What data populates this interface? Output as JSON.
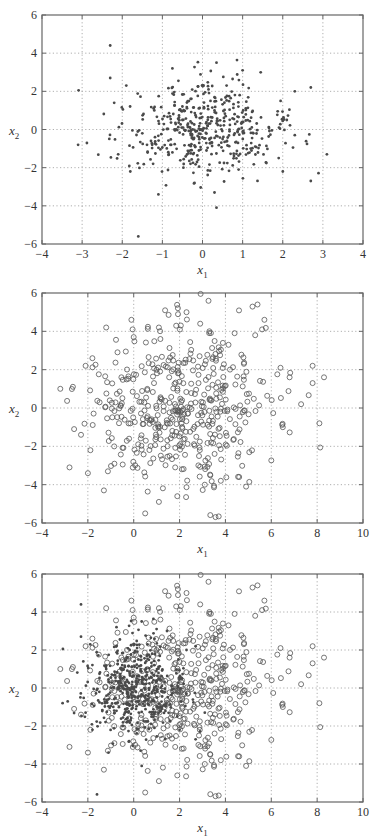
{
  "chart_data": [
    {
      "type": "scatter",
      "title": "",
      "xlabel": "x1",
      "ylabel": "x2",
      "xlim": [
        -4,
        4
      ],
      "ylim": [
        -6,
        6
      ],
      "xticks": [
        -4,
        -3,
        -2,
        -1,
        0,
        1,
        2,
        3,
        4
      ],
      "yticks": [
        -6,
        -4,
        -2,
        0,
        2,
        4,
        6
      ],
      "grid": true,
      "legend": null,
      "series": [
        {
          "name": "class 1",
          "marker": "dot",
          "color": "#4a4a4a",
          "approx_count": 500,
          "distribution": {
            "mean": [
              0,
              0
            ],
            "std": [
              1,
              1.2
            ]
          },
          "sample_points": [
            [
              -2.3,
              4.4
            ],
            [
              -2.3,
              2.7
            ],
            [
              -3.1,
              -0.8
            ],
            [
              3.1,
              -1.3
            ],
            [
              2.7,
              2.2
            ],
            [
              2.7,
              -2.7
            ],
            [
              -1.6,
              -5.6
            ],
            [
              0.35,
              3.5
            ],
            [
              1.0,
              3.1
            ],
            [
              1.45,
              3.0
            ],
            [
              2.3,
              2.0
            ],
            [
              0.35,
              -4.1
            ],
            [
              -0.75,
              3.2
            ],
            [
              -1.9,
              2.3
            ],
            [
              -2.2,
              1.4
            ],
            [
              -2.1,
              -1.3
            ],
            [
              -1.8,
              -2.2
            ],
            [
              1.9,
              -1.5
            ],
            [
              2.0,
              -2.2
            ],
            [
              2.3,
              -0.3
            ],
            [
              2.1,
              0.5
            ],
            [
              -1.1,
              -3.4
            ],
            [
              0.3,
              -3.3
            ],
            [
              -0.2,
              -2.8
            ],
            [
              0.0,
              0.0
            ],
            [
              0.5,
              -0.5
            ],
            [
              -0.5,
              0.5
            ],
            [
              0.8,
              0.8
            ],
            [
              -0.8,
              -0.8
            ],
            [
              0.2,
              1.5
            ],
            [
              -1.2,
              1.0
            ],
            [
              1.2,
              -1.0
            ],
            [
              0.9,
              -2.1
            ],
            [
              -0.3,
              -1.8
            ],
            [
              0.6,
              2.3
            ],
            [
              -1.5,
              -0.2
            ]
          ]
        }
      ]
    },
    {
      "type": "scatter",
      "title": "",
      "xlabel": "x1",
      "ylabel": "x2",
      "xlim": [
        -4,
        10
      ],
      "ylim": [
        -6,
        6
      ],
      "xticks": [
        -4,
        -2,
        0,
        2,
        4,
        6,
        8,
        10
      ],
      "yticks": [
        -6,
        -4,
        -2,
        0,
        2,
        4,
        6
      ],
      "grid": true,
      "legend": null,
      "series": [
        {
          "name": "class 2",
          "marker": "circle",
          "color": "#555555",
          "approx_count": 500,
          "distribution": {
            "mean": [
              2,
              0
            ],
            "std": [
              2,
              2
            ]
          },
          "sample_points": [
            [
              5.4,
              5.4
            ],
            [
              2.3,
              5.0
            ],
            [
              -0.1,
              4.6
            ],
            [
              5.7,
              4.6
            ],
            [
              2.9,
              4.4
            ],
            [
              -1.2,
              4.2
            ],
            [
              1.1,
              4.2
            ],
            [
              5.6,
              4.1
            ],
            [
              5.3,
              3.8
            ],
            [
              3.3,
              4.0
            ],
            [
              4.4,
              3.9
            ],
            [
              -3.2,
              1.0
            ],
            [
              -2.8,
              -3.1
            ],
            [
              -1.3,
              -4.3
            ],
            [
              0.5,
              -5.5
            ],
            [
              1.1,
              -4.9
            ],
            [
              1.9,
              -4.6
            ],
            [
              4.9,
              -4.1
            ],
            [
              8.3,
              1.6
            ],
            [
              7.8,
              2.2
            ],
            [
              7.8,
              1.3
            ],
            [
              8.1,
              -0.8
            ],
            [
              7.3,
              0.2
            ],
            [
              6.8,
              1.6
            ],
            [
              6.4,
              2.1
            ],
            [
              6.5,
              -1.0
            ],
            [
              -2.6,
              -1.1
            ],
            [
              -2.3,
              -1.4
            ],
            [
              -2.0,
              -3.4
            ],
            [
              -2.1,
              2.2
            ],
            [
              -1.8,
              2.6
            ],
            [
              2.1,
              -3.2
            ],
            [
              3.1,
              -4.0
            ],
            [
              3.8,
              -3.8
            ],
            [
              4.6,
              -3.6
            ],
            [
              0.0,
              3.7
            ]
          ]
        }
      ]
    },
    {
      "type": "scatter",
      "title": "",
      "xlabel": "x1",
      "ylabel": "x2",
      "xlim": [
        -4,
        10
      ],
      "ylim": [
        -6,
        6
      ],
      "xticks": [
        -4,
        -2,
        0,
        2,
        4,
        6,
        8,
        10
      ],
      "yticks": [
        -6,
        -4,
        -2,
        0,
        2,
        4,
        6
      ],
      "grid": true,
      "legend": null,
      "series": [
        {
          "name": "class 1",
          "marker": "dot",
          "color": "#4a4a4a",
          "approx_count": 500,
          "distribution": {
            "mean": [
              0,
              0
            ],
            "std": [
              1,
              1.2
            ]
          },
          "sample_points": [
            [
              -2.3,
              3.1
            ],
            [
              -2.3,
              1.6
            ],
            [
              -3.1,
              -0.4
            ],
            [
              -1.6,
              -3.7
            ],
            [
              0.0,
              0.0
            ],
            [
              0.5,
              -0.5
            ],
            [
              -0.5,
              0.5
            ],
            [
              -1.0,
              1.2
            ],
            [
              1.0,
              -1.0
            ],
            [
              -1.5,
              -1.0
            ]
          ]
        },
        {
          "name": "class 2",
          "marker": "circle",
          "color": "#555555",
          "approx_count": 500,
          "distribution": {
            "mean": [
              2,
              0
            ],
            "std": [
              2,
              2
            ]
          },
          "sample_points": [
            [
              5.4,
              5.4
            ],
            [
              2.3,
              5.0
            ],
            [
              -0.1,
              4.6
            ],
            [
              5.7,
              4.6
            ],
            [
              -3.2,
              1.0
            ],
            [
              -2.8,
              -3.1
            ],
            [
              0.5,
              -5.5
            ],
            [
              8.3,
              1.6
            ],
            [
              7.8,
              2.2
            ],
            [
              8.1,
              -0.8
            ],
            [
              7.3,
              0.2
            ],
            [
              4.9,
              -4.1
            ]
          ]
        }
      ]
    }
  ],
  "panels": [
    {
      "y_label_main": "x",
      "y_label_sub": "2",
      "x_label_main": "x",
      "x_label_sub": "1"
    },
    {
      "y_label_main": "x",
      "y_label_sub": "2",
      "x_label_main": "x",
      "x_label_sub": "1"
    },
    {
      "y_label_main": "x",
      "y_label_sub": "2",
      "x_label_main": "x",
      "x_label_sub": "1"
    }
  ]
}
